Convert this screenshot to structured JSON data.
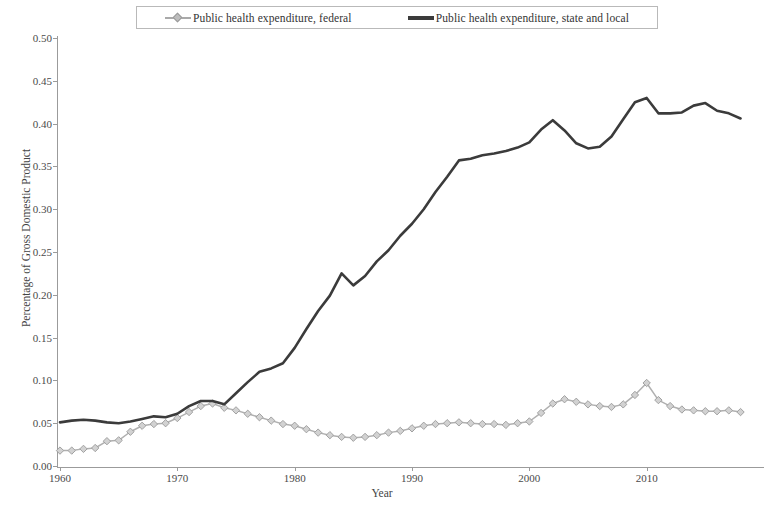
{
  "chart_data": {
    "type": "line",
    "title": "",
    "xlabel": "Year",
    "ylabel": "Percentage of Gross Domestic Product",
    "xlim": [
      1960,
      2020
    ],
    "ylim": [
      0.0,
      0.5
    ],
    "xticks": [
      "1960",
      "1970",
      "1980",
      "1990",
      "2000",
      "2010"
    ],
    "xtick_values": [
      1960,
      1970,
      1980,
      1990,
      2000,
      2010
    ],
    "yticks": [
      "0.00",
      "0.05",
      "0.10",
      "0.15",
      "0.20",
      "0.25",
      "0.30",
      "0.35",
      "0.40",
      "0.45",
      "0.50"
    ],
    "ytick_values": [
      0.0,
      0.05,
      0.1,
      0.15,
      0.2,
      0.25,
      0.3,
      0.35,
      0.4,
      0.45,
      0.5
    ],
    "grid": false,
    "legend_position": "top-center",
    "x": [
      1960,
      1961,
      1962,
      1963,
      1964,
      1965,
      1966,
      1967,
      1968,
      1969,
      1970,
      1971,
      1972,
      1973,
      1974,
      1975,
      1976,
      1977,
      1978,
      1979,
      1980,
      1981,
      1982,
      1983,
      1984,
      1985,
      1986,
      1987,
      1988,
      1989,
      1990,
      1991,
      1992,
      1993,
      1994,
      1995,
      1996,
      1997,
      1998,
      1999,
      2000,
      2001,
      2002,
      2003,
      2004,
      2005,
      2006,
      2007,
      2008,
      2009,
      2010,
      2011,
      2012,
      2013,
      2014,
      2015,
      2016,
      2017,
      2018
    ],
    "series": [
      {
        "name": "Public health expenditure, federal",
        "color": "#b0b0b0",
        "marker": "diamond",
        "values": [
          0.018,
          0.018,
          0.02,
          0.021,
          0.029,
          0.03,
          0.04,
          0.047,
          0.049,
          0.05,
          0.056,
          0.063,
          0.07,
          0.073,
          0.068,
          0.065,
          0.061,
          0.057,
          0.053,
          0.049,
          0.047,
          0.043,
          0.039,
          0.036,
          0.034,
          0.033,
          0.034,
          0.036,
          0.039,
          0.041,
          0.044,
          0.047,
          0.049,
          0.05,
          0.051,
          0.05,
          0.049,
          0.049,
          0.048,
          0.05,
          0.052,
          0.062,
          0.073,
          0.078,
          0.075,
          0.072,
          0.07,
          0.069,
          0.072,
          0.083,
          0.097,
          0.077,
          0.07,
          0.066,
          0.065,
          0.064,
          0.064,
          0.065,
          0.063
        ]
      },
      {
        "name": "Public health expenditure, state and local",
        "color": "#3b3b3b",
        "marker": "none",
        "values": [
          0.051,
          0.053,
          0.054,
          0.053,
          0.051,
          0.05,
          0.052,
          0.055,
          0.058,
          0.057,
          0.061,
          0.07,
          0.076,
          0.076,
          0.072,
          0.085,
          0.098,
          0.11,
          0.114,
          0.12,
          0.138,
          0.16,
          0.181,
          0.199,
          0.225,
          0.211,
          0.222,
          0.239,
          0.252,
          0.269,
          0.283,
          0.3,
          0.32,
          0.338,
          0.357,
          0.359,
          0.363,
          0.365,
          0.368,
          0.372,
          0.378,
          0.393,
          0.404,
          0.392,
          0.377,
          0.371,
          0.373,
          0.385,
          0.405,
          0.425,
          0.43,
          0.412,
          0.412,
          0.413,
          0.421,
          0.424,
          0.415,
          0.412,
          0.406
        ]
      }
    ]
  },
  "legend": {
    "entries": [
      {
        "label": "Public health expenditure, federal",
        "icon": "line-with-diamond-marker"
      },
      {
        "label": "Public health expenditure, state and local",
        "icon": "thick-line"
      }
    ]
  },
  "axes": {
    "x_title": "Year",
    "y_title": "Percentage of Gross Domestic Product"
  }
}
